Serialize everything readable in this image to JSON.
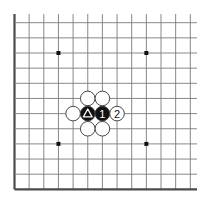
{
  "diagram": {
    "type": "go-board-partial",
    "columns": 13,
    "rows": 12,
    "edges": {
      "left": "border",
      "bottom": "border",
      "top": "open",
      "right": "open"
    },
    "colors": {
      "background": "#ffffff",
      "grid": "#7a7a7a",
      "border": "#4a4a4a",
      "black_stone": "#111111",
      "white_stone": "#ffffff",
      "stone_outline": "#333333",
      "star_point": "#111111"
    },
    "star_points": [
      {
        "col": 3,
        "row": 2
      },
      {
        "col": 9,
        "row": 2
      },
      {
        "col": 3,
        "row": 8
      },
      {
        "col": 9,
        "row": 8
      }
    ],
    "stones": [
      {
        "color": "black",
        "col": 5,
        "row": 6,
        "label": "",
        "marker": "triangle"
      },
      {
        "color": "black",
        "col": 6,
        "row": 6,
        "label": "1",
        "marker": ""
      },
      {
        "color": "white",
        "col": 7,
        "row": 6,
        "label": "2",
        "marker": ""
      },
      {
        "color": "white",
        "col": 4,
        "row": 6,
        "label": "",
        "marker": ""
      },
      {
        "color": "white",
        "col": 5,
        "row": 5,
        "label": "",
        "marker": ""
      },
      {
        "color": "white",
        "col": 6,
        "row": 5,
        "label": "",
        "marker": ""
      },
      {
        "color": "white",
        "col": 5,
        "row": 7,
        "label": "",
        "marker": ""
      },
      {
        "color": "white",
        "col": 6,
        "row": 7,
        "label": "",
        "marker": ""
      }
    ]
  }
}
